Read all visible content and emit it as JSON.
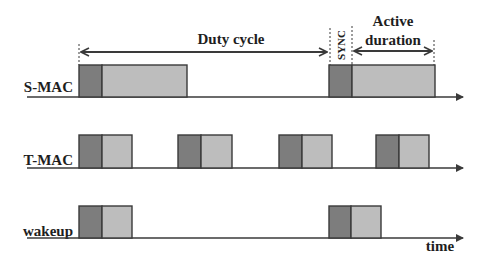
{
  "diagram": {
    "type": "timing",
    "colors": {
      "sync": "#7d7d7d",
      "active": "#bdbdbd",
      "border": "#3a3a3a",
      "axis": "#3a3a3a",
      "text": "#1e1e1e"
    },
    "annotations": {
      "duty_cycle": "Duty cycle",
      "sync": "SYNC",
      "active_line1": "Active",
      "active_line2": "duration",
      "time_axis": "time"
    },
    "rows": [
      {
        "label": "S-MAC",
        "blocks": [
          {
            "x": 79,
            "sync_w": 23,
            "active_w": 85
          },
          {
            "x": 329,
            "sync_w": 23,
            "active_w": 83
          }
        ]
      },
      {
        "label": "T-MAC",
        "blocks": [
          {
            "x": 79,
            "sync_w": 23,
            "active_w": 30
          },
          {
            "x": 178,
            "sync_w": 23,
            "active_w": 31
          },
          {
            "x": 279,
            "sync_w": 23,
            "active_w": 30
          },
          {
            "x": 376,
            "sync_w": 23,
            "active_w": 30
          }
        ]
      },
      {
        "label": "wakeup",
        "blocks": [
          {
            "x": 79,
            "sync_w": 23,
            "active_w": 30
          },
          {
            "x": 329,
            "sync_w": 22,
            "active_w": 30
          }
        ]
      }
    ]
  }
}
